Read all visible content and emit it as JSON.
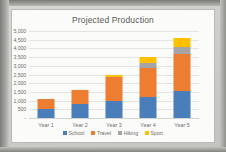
{
  "chart_data": {
    "type": "bar",
    "subtype": "stacked-column",
    "title": "Projected Production",
    "xlabel": "",
    "ylabel": "",
    "categories": [
      "Year 1",
      "Year 2",
      "Year 3",
      "Year 4",
      "Year 5"
    ],
    "series": [
      {
        "name": "School",
        "color": "#4a7ebb",
        "values": [
          500,
          800,
          1000,
          1200,
          1550
        ]
      },
      {
        "name": "Travel",
        "color": "#ed7d31",
        "values": [
          600,
          800,
          1350,
          1650,
          2150
        ]
      },
      {
        "name": "Hiking",
        "color": "#a5a5a5",
        "values": [
          0,
          0,
          0,
          300,
          400
        ]
      },
      {
        "name": "Sport",
        "color": "#ffc000",
        "values": [
          0,
          0,
          100,
          350,
          500
        ]
      }
    ],
    "totals": [
      1100,
      1600,
      2450,
      3500,
      4600
    ],
    "ylim": [
      0,
      5000
    ],
    "ytick_values": [
      0,
      500,
      1000,
      1500,
      2000,
      2500,
      3000,
      3500,
      4000,
      4500,
      5000
    ],
    "ytick_labels": [
      "-",
      "500",
      "1,000",
      "1,500",
      "2,000",
      "2,500",
      "3,000",
      "3,500",
      "4,000",
      "4,500",
      "5,000"
    ],
    "grid": true,
    "legend_position": "bottom",
    "legend": [
      "School",
      "Travel",
      "Hiking",
      "Sport"
    ]
  },
  "colors": {
    "series_school": "#4a7ebb",
    "series_travel": "#ed7d31",
    "series_hiking": "#a5a5a5",
    "series_sport": "#ffc000",
    "gridline": "#e4e4e2",
    "chart_background": "#fbfbfa",
    "axis_text": "#6d6d6d",
    "title_text": "#585858"
  }
}
